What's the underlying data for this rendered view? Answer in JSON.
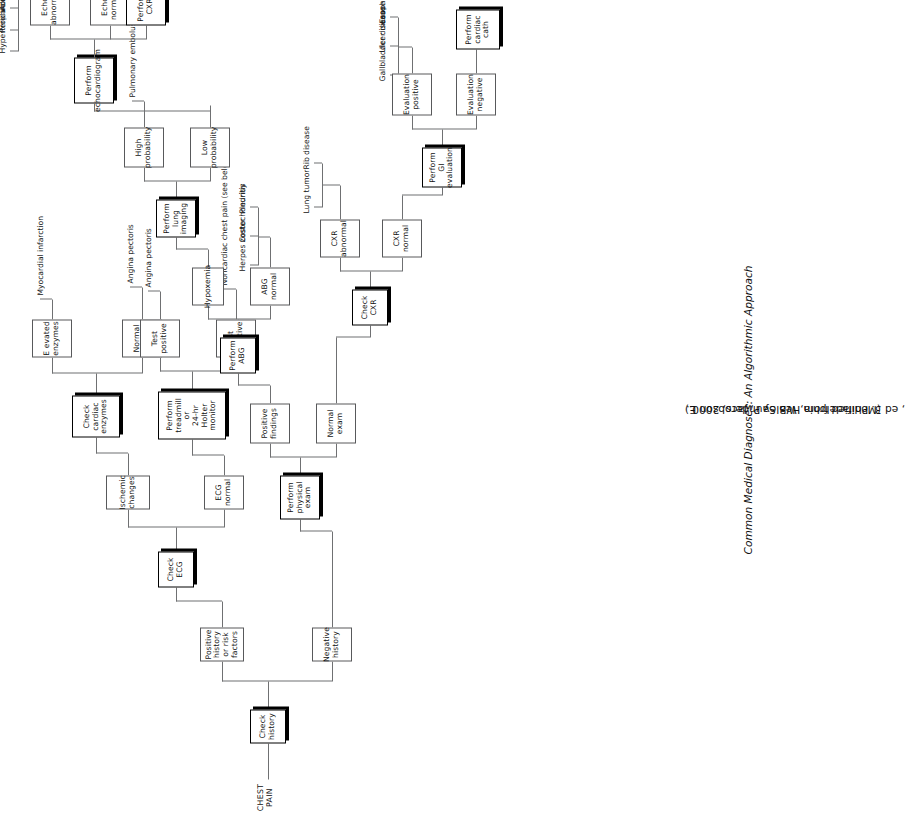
{
  "figure": {
    "entry_label": "CHEST\nPAIN",
    "caption_prefix": "(Modified from Healey P, Jacobson E. ",
    "caption_italic": "Common Medical Diagnoses: An Algorithmic Approach",
    "caption_suffix": ", ed 3. Philadelphia, WB Saunders, 2000.)",
    "orientation": "rotated-90-ccw",
    "line_color": "#6f7072",
    "box_border_color": "#58595b",
    "shadow_color": "#000000"
  },
  "actions": {
    "check_history": "Check\nhistory",
    "check_ecg": "Check\nECG",
    "check_cardiac_enzymes": "Check\ncardiac\nenzymes",
    "perform_treadmill": "Perform\ntreadmill\nor\n24-hr\nHolter\nmonitor",
    "perform_physical_exam": "Perform\nphysical\nexam",
    "perform_abg": "Perform\nABG",
    "perform_lung_imaging": "Perform\nlung\nimaging",
    "perform_echocardiogram": "Perform\nechocardiogram",
    "perform_cxr": "Perform\nCXR",
    "check_cxr": "Check\nCXR",
    "perform_gi_evaluation": "Perform\nGI evaluation",
    "perform_cardiac_cath": "Perform\ncardiac\ncath"
  },
  "decisions": {
    "positive_history": "Positive\nhistory\nor risk\nfactors",
    "negative_history": "Negative\nhistory",
    "ischemic_changes": "Ischemic\nchanges",
    "ecg_normal": "ECG\nnormal",
    "elevated_enzymes": "E evated\nenzymes",
    "normal_enzymes": "Normal\nenzymes",
    "test_positive": "Test\npositive",
    "test_negative": "Test\nnegative",
    "positive_findings": "Positive\nfindings",
    "normal_exam": "Normal\nexam",
    "hypoxemia": "Hypoxemia",
    "abg_normal": "ABG\nnormal",
    "high_probability": "High\nprobability",
    "low_probability": "Low\nprobability",
    "echo_abnormal": "Echo\nabnormal",
    "echo_normal": "Echo\nnormal",
    "cxr_abnormal_echo": "CXR\nabnormal",
    "cxr_normal_echo": "CXR\nnormal",
    "cxr_abnormal_exam": "CXR\nabnormal",
    "cxr_normal_exam": "CXR\nnormal",
    "evaluation_positive": "Evaluation\npositive",
    "evaluation_negative": "Evaluation\nnegative",
    "cath_positive": "Cath\npositive",
    "cath_negative": "Cath\nnegative"
  },
  "terminals": {
    "myocardial_infarction": "Myocardial infarction",
    "angina_pectoris_1": "Angina pectoris",
    "angina_pectoris_2": "Angina pectoris",
    "noncardiac_chest_pain": "Noncardiac chest pain (see below)",
    "pulmonary_embolus": "Pulmonary embolus",
    "herpes_zoster": "Herpes zoster",
    "costochondritis": "Costochondritis",
    "pleurisy": "Pleurisy",
    "lung_tumor": "Lung tumor",
    "rib_disease": "Rib disease",
    "hypertrophic_cardiomyopathy": "Hypertrophic cardiomyopathy",
    "pericarditis": "Pericarditis",
    "aortic_stenosis": "Aortic stenosis",
    "myocarditis": "Myocarditis",
    "mitral_valve_prolapse": "Mitral valve prolapse",
    "aortic_aneurysm": "Aortic aneurysm",
    "pneumonia": "Pneumonia",
    "pleural_effusion": "Pleural effusion",
    "pneumothorax": "Pneumothorax",
    "intrinsic_lung_disease": "Intrinsic lung disease",
    "gallbladder_disease": "Gallbladder disease",
    "ulcer_disease": "Ulcer disease",
    "esophageal_disease": "Esophageal disease",
    "variant_angina": "Variant angina",
    "cocaine_abuse": "Cocaine abuse",
    "psychogenic_pain": "Psychogenic pain",
    "skeletal_pain": "Skeletal pain"
  }
}
